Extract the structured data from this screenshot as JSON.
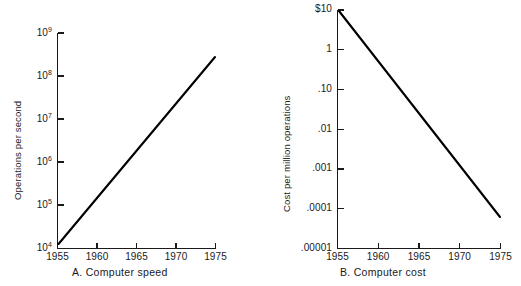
{
  "figure": {
    "background_color": "#ffffff",
    "ink_color": "#111111",
    "panel_count": 2
  },
  "chart_data": [
    {
      "id": "panel-a",
      "type": "line",
      "title": "A.  Computer speed",
      "caption_letter": "A.",
      "caption_text": "Computer speed",
      "xlabel": "",
      "ylabel": "Operations per second",
      "yscale": "log",
      "xscale": "linear",
      "xlim": [
        1955,
        1975
      ],
      "ylim": [
        10000,
        1000000000
      ],
      "grid": false,
      "legend": false,
      "xticks": [
        1955,
        1960,
        1965,
        1970,
        1975
      ],
      "xticklabels": [
        "1955",
        "1960",
        "1965",
        "1970",
        "1975"
      ],
      "yticks": [
        10000,
        100000,
        1000000,
        10000000,
        100000000,
        1000000000
      ],
      "yticklabels": [
        {
          "mantissa": "10",
          "exponent": "4"
        },
        {
          "mantissa": "10",
          "exponent": "5"
        },
        {
          "mantissa": "10",
          "exponent": "6"
        },
        {
          "mantissa": "10",
          "exponent": "7"
        },
        {
          "mantissa": "10",
          "exponent": "8"
        },
        {
          "mantissa": "10",
          "exponent": "9"
        }
      ],
      "series": [
        {
          "name": "Operations per second",
          "color": "#000000",
          "x": [
            1955,
            1960,
            1965,
            1970,
            1975
          ],
          "y": [
            12000,
            700000,
            8000000,
            80000000,
            600000000
          ]
        }
      ],
      "annotations": []
    },
    {
      "id": "panel-b",
      "type": "line",
      "title": "B.  Computer cost",
      "caption_letter": "B.",
      "caption_text": "Computer cost",
      "xlabel": "",
      "ylabel": "Cost per million operations",
      "yscale": "log",
      "xscale": "linear",
      "xlim": [
        1955,
        1975
      ],
      "ylim": [
        1e-05,
        10
      ],
      "grid": false,
      "legend": false,
      "xticks": [
        1955,
        1960,
        1965,
        1970,
        1975
      ],
      "xticklabels": [
        "1955",
        "1960",
        "1965",
        "1970",
        "1975"
      ],
      "yticks": [
        10,
        1,
        0.1,
        0.01,
        0.001,
        0.0001,
        1e-05
      ],
      "yticklabels": [
        "$10",
        "1",
        ".10",
        ".01",
        ".001",
        ".0001",
        ".00001"
      ],
      "series": [
        {
          "name": "Cost per million operations",
          "color": "#000000",
          "x": [
            1955,
            1960,
            1965,
            1970,
            1975
          ],
          "y": [
            10,
            0.18,
            0.003,
            6e-05,
            6e-05
          ]
        }
      ],
      "annotations": []
    }
  ]
}
